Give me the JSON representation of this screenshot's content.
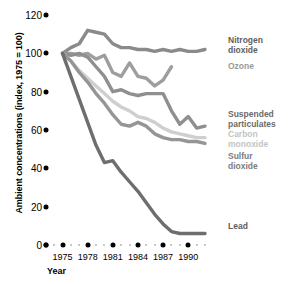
{
  "chart_data": {
    "type": "line",
    "title": "",
    "subtitle": "",
    "xlabel": "Year",
    "ylabel": "Ambient concentrations (index, 1975 = 100)",
    "x": [
      1975,
      1976,
      1977,
      1978,
      1979,
      1980,
      1981,
      1982,
      1983,
      1984,
      1985,
      1986,
      1987,
      1988,
      1989,
      1990,
      1991,
      1992
    ],
    "xlim": [
      1975,
      1992
    ],
    "ylim": [
      0,
      120
    ],
    "yticks": [
      0,
      20,
      40,
      60,
      80,
      100,
      120
    ],
    "xticks": [
      1975,
      1978,
      1981,
      1984,
      1987,
      1990
    ],
    "grid": false,
    "legend_position": "right-inline",
    "series": [
      {
        "name": "Nitrogen dioxide",
        "color": "#8a8a8a",
        "values": [
          100,
          103,
          105,
          112,
          111,
          110,
          105,
          103,
          103,
          102,
          102,
          101,
          102,
          101,
          102,
          101,
          101,
          102
        ]
      },
      {
        "name": "Ozone",
        "color": "#9e9e9e",
        "values": [
          100,
          100,
          99,
          100,
          97,
          99,
          90,
          88,
          95,
          88,
          87,
          83,
          86,
          93,
          null,
          null,
          null,
          null
        ]
      },
      {
        "name": "Suspended particulates",
        "color": "#8f8f8f",
        "values": [
          100,
          99,
          100,
          98,
          93,
          88,
          80,
          81,
          79,
          78,
          79,
          79,
          79,
          70,
          63,
          67,
          61,
          62
        ]
      },
      {
        "name": "Carbon monoxide",
        "color": "#cfcfcf",
        "values": [
          100,
          96,
          91,
          87,
          83,
          79,
          75,
          72,
          70,
          67,
          66,
          64,
          61,
          59,
          58,
          57,
          56,
          56
        ]
      },
      {
        "name": "Sulfur dioxide",
        "color": "#959595",
        "values": [
          100,
          96,
          90,
          85,
          79,
          74,
          68,
          63,
          62,
          64,
          62,
          58,
          56,
          55,
          55,
          54,
          54,
          53
        ]
      },
      {
        "name": "Lead",
        "color": "#6e6e6e",
        "values": [
          100,
          88,
          76,
          64,
          52,
          43,
          44,
          38,
          33,
          28,
          22,
          16,
          11,
          7,
          6,
          6,
          6,
          6
        ]
      }
    ]
  },
  "axis": {
    "y_title": "Ambient concentrations (index, 1975 = 100)",
    "x_title": "Year",
    "y_labels": [
      "120",
      "100",
      "80",
      "60",
      "40",
      "20",
      "0"
    ],
    "x_labels": [
      "1975",
      "1978",
      "1981",
      "1984",
      "1987",
      "1990"
    ]
  },
  "legend": {
    "items": [
      {
        "label_line1": "Nitrogen",
        "label_line2": "dioxide",
        "color": "#5e5e5e"
      },
      {
        "label_line1": "Ozone",
        "label_line2": "",
        "color": "#9a9a9a"
      },
      {
        "label_line1": "Suspended",
        "label_line2": "particulates",
        "color": "#6b6b6b"
      },
      {
        "label_line1": "Carbon",
        "label_line2": "monoxide",
        "color": "#c4c4c4"
      },
      {
        "label_line1": "Sulfur",
        "label_line2": "dioxide",
        "color": "#7c7c7c"
      },
      {
        "label_line1": "Lead",
        "label_line2": "",
        "color": "#5e5e5e"
      }
    ]
  }
}
